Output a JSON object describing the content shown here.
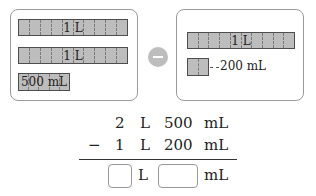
{
  "left_panel": {
    "bars": [
      {
        "label": "1 L",
        "cells": 10
      },
      {
        "label": "1 L",
        "cells": 10
      },
      {
        "label": "500 mL",
        "cells": 5
      }
    ]
  },
  "operator": {
    "icon": "minus-icon"
  },
  "right_panel": {
    "bars": [
      {
        "label": "1 L",
        "cells": 10
      },
      {
        "label": "",
        "cells": 2
      }
    ],
    "callout": "200 mL"
  },
  "calculation": {
    "row1": {
      "whole": "2",
      "unit1": "L",
      "part": "500",
      "unit2": "mL"
    },
    "row2": {
      "sign": "−",
      "whole": "1",
      "unit1": "L",
      "part": "200",
      "unit2": "mL"
    },
    "answer": {
      "unit1": "L",
      "unit2": "mL",
      "whole_value": "",
      "part_value": ""
    }
  },
  "colors": {
    "bar_fill": "#bdbdbd",
    "border": "#9a9a9a"
  }
}
